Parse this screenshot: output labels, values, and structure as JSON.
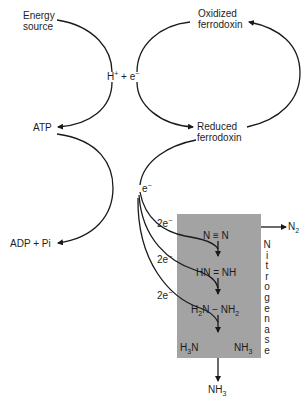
{
  "diagram": {
    "title": "",
    "nodes": {
      "energy_source": [
        "Energy",
        "source"
      ],
      "h_plus_e": {
        "h": "H",
        "h_sup": "+",
        "plus": "+",
        "e": "e",
        "e_sup": "−"
      },
      "oxidized_ferrodoxin": [
        "Oxidized",
        "ferrodoxin"
      ],
      "reduced_ferrodoxin": [
        "Reduced",
        "ferrodoxin"
      ],
      "atp": "ATP",
      "adp_pi": "ADP + Pi",
      "electron": {
        "e": "e",
        "sup": "−"
      },
      "two_e": [
        {
          "text": "2e",
          "sup": "−"
        },
        {
          "text": "2e",
          "sup": "−"
        },
        {
          "text": "2e",
          "sup": "−"
        }
      ],
      "n2_out": {
        "text": "N",
        "sub": "2"
      },
      "nh3_out": {
        "text": "NH",
        "sub": "3"
      }
    },
    "enzyme": {
      "name_letters": [
        "N",
        "i",
        "t",
        "r",
        "o",
        "g",
        "e",
        "n",
        "a",
        "s",
        "e"
      ],
      "box_color": "#a3a3a3",
      "steps": [
        {
          "text": "N ≡ N"
        },
        {
          "text": "HN = NH"
        },
        {
          "h2n": "H",
          "h2n_sub": "2",
          "h2n_rest": "N",
          "dash": " − ",
          "nh2": "NH",
          "nh2_sub": "2"
        },
        {
          "left": "H",
          "left_sub": "3",
          "left_rest": "N",
          "right": "NH",
          "right_sub": "3"
        }
      ]
    },
    "edges": [
      "Energy source → H+ + e− → ATP",
      "ATP → ADP + Pi",
      "H+ + e− → Oxidized ferrodoxin",
      "Oxidized ferrodoxin → Reduced ferrodoxin",
      "Reduced ferrodoxin → e− → 2e− → Nitrogenase steps",
      "Nitrogenase → N2",
      "Nitrogenase → NH3"
    ]
  }
}
